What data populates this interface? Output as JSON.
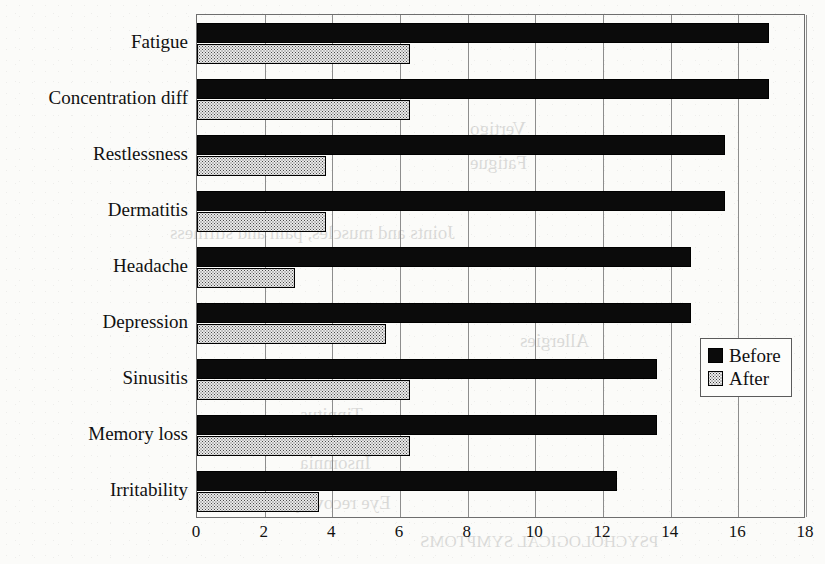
{
  "chart_data": {
    "type": "bar",
    "orientation": "horizontal",
    "title": "",
    "xlabel": "",
    "ylabel": "",
    "xlim": [
      0,
      18
    ],
    "xticks": [
      "0",
      "2",
      "4",
      "6",
      "8",
      "10",
      "12",
      "14",
      "16",
      "18"
    ],
    "xtick_step": 2,
    "grid": true,
    "grid_axis": "x",
    "legend_position": "center-right",
    "categories": [
      "Fatigue",
      "Concentration diff",
      "Restlessness",
      "Dermatitis",
      "Headache",
      "Depression",
      "Sinusitis",
      "Memory loss",
      "Irritability"
    ],
    "series": [
      {
        "name": "Before",
        "fill": "solid-black",
        "color": "#0b0b0b",
        "values": [
          16.9,
          16.9,
          15.6,
          15.6,
          14.6,
          14.6,
          13.6,
          13.6,
          12.4
        ]
      },
      {
        "name": "After",
        "fill": "stippled-light",
        "color": "#e9e9e9",
        "values": [
          6.3,
          6.3,
          3.8,
          3.8,
          2.9,
          5.6,
          6.3,
          6.3,
          3.6
        ]
      }
    ]
  },
  "legend": {
    "items": [
      {
        "label": "Before",
        "swatch": "black-square-icon"
      },
      {
        "label": "After",
        "swatch": "dotted-square-icon"
      }
    ]
  },
  "page_bleed_text": [
    {
      "text": "Headache",
      "x": 560,
      "y": 78,
      "size": 19
    },
    {
      "text": "Vertigo",
      "x": 470,
      "y": 118,
      "size": 19
    },
    {
      "text": "Fatigue",
      "x": 470,
      "y": 152,
      "size": 19
    },
    {
      "text": "Joints and muscles, pain and stiffness",
      "x": 170,
      "y": 222,
      "size": 19
    },
    {
      "text": "Allergies",
      "x": 520,
      "y": 330,
      "size": 19
    },
    {
      "text": "Tinnitus",
      "x": 300,
      "y": 404,
      "size": 19
    },
    {
      "text": "Insomnia",
      "x": 300,
      "y": 452,
      "size": 19
    },
    {
      "text": "Eye recovery",
      "x": 290,
      "y": 492,
      "size": 19
    },
    {
      "text": "PSYCHOLOGICAL SYMPTOMS",
      "x": 420,
      "y": 532,
      "size": 17
    }
  ]
}
